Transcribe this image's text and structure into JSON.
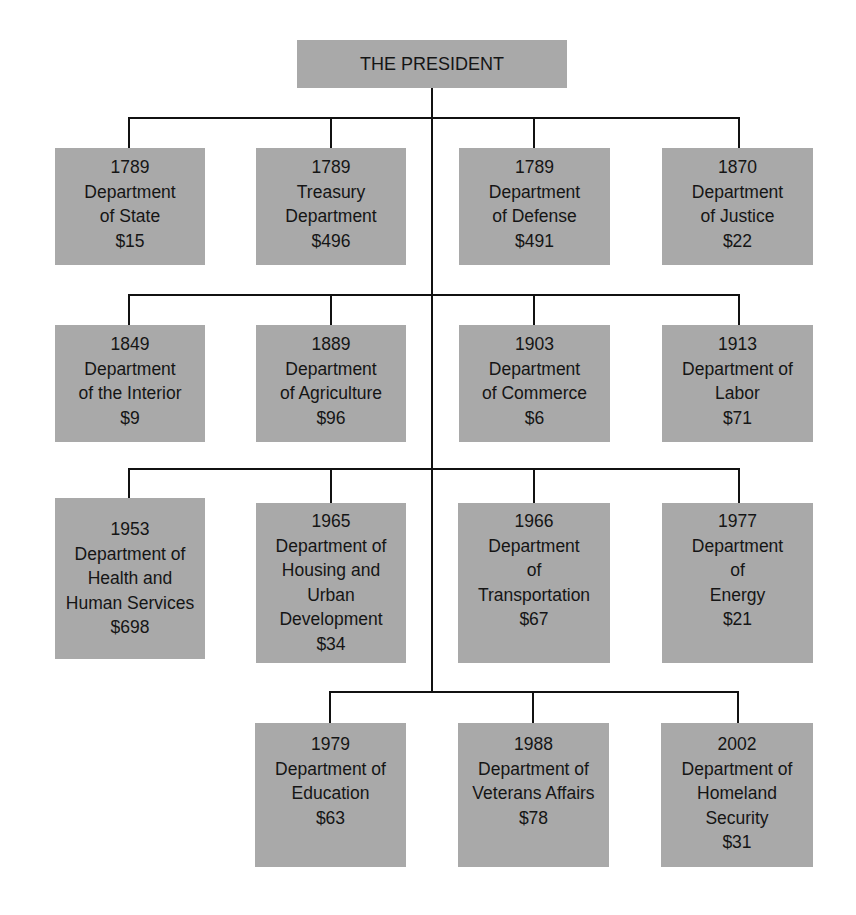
{
  "chart": {
    "root": {
      "label": "THE PRESIDENT"
    },
    "rows": [
      {
        "departments": [
          {
            "year": "1789",
            "lines": [
              "Department",
              "of State"
            ],
            "amount": "$15"
          },
          {
            "year": "1789",
            "lines": [
              "Treasury",
              "Department"
            ],
            "amount": "$496"
          },
          {
            "year": "1789",
            "lines": [
              "Department",
              "of Defense"
            ],
            "amount": "$491"
          },
          {
            "year": "1870",
            "lines": [
              "Department",
              "of Justice"
            ],
            "amount": "$22"
          }
        ]
      },
      {
        "departments": [
          {
            "year": "1849",
            "lines": [
              "Department",
              "of the Interior"
            ],
            "amount": "$9"
          },
          {
            "year": "1889",
            "lines": [
              "Department",
              "of Agriculture"
            ],
            "amount": "$96"
          },
          {
            "year": "1903",
            "lines": [
              "Department",
              "of Commerce"
            ],
            "amount": "$6"
          },
          {
            "year": "1913",
            "lines": [
              "Department of",
              "Labor"
            ],
            "amount": "$71"
          }
        ]
      },
      {
        "departments": [
          {
            "year": "1953",
            "lines": [
              "Department of",
              "Health and",
              "Human Services"
            ],
            "amount": "$698"
          },
          {
            "year": "1965",
            "lines": [
              "Department of",
              "Housing and",
              "Urban",
              "Development"
            ],
            "amount": "$34"
          },
          {
            "year": "1966",
            "lines": [
              "Department",
              "of",
              "Transportation"
            ],
            "amount": "$67"
          },
          {
            "year": "1977",
            "lines": [
              "Department",
              "of",
              "Energy"
            ],
            "amount": "$21"
          }
        ]
      },
      {
        "departments": [
          {
            "year": "1979",
            "lines": [
              "Department of",
              "Education"
            ],
            "amount": "$63"
          },
          {
            "year": "1988",
            "lines": [
              "Department of",
              "Veterans Affairs"
            ],
            "amount": "$78"
          },
          {
            "year": "2002",
            "lines": [
              "Department of",
              "Homeland",
              "Security"
            ],
            "amount": "$31"
          }
        ]
      }
    ]
  },
  "colors": {
    "box_fill": "#a9a9a9",
    "line": "#111111",
    "text": "#151515",
    "background": "#ffffff"
  }
}
